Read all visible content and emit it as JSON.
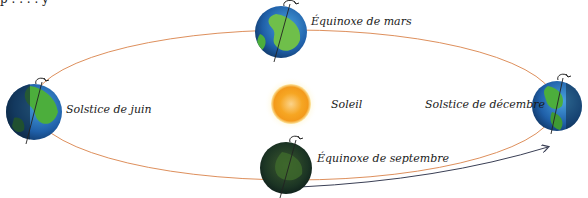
{
  "top_fragment": "p . . . . y",
  "colors": {
    "orbit": "#d9824a",
    "arrow": "#3a3f55",
    "sun_core": "#f6a623",
    "sun_glow": "#fde9a8",
    "earth_ocean": "#1f5fa8",
    "earth_land": "#4cae3c",
    "earth_dark": "#0f2a3a",
    "axis": "#222222"
  },
  "sun": {
    "label": "Soleil",
    "cx": 291,
    "cy": 104,
    "r": 20
  },
  "orbit": {
    "cx": 294,
    "cy": 105,
    "rx": 262,
    "ry": 75
  },
  "positions": [
    {
      "id": "solstice-juin",
      "label": "Solstice de juin",
      "cx": 34,
      "cy": 112,
      "r": 28,
      "phase": "lit-right"
    },
    {
      "id": "equinoxe-mars",
      "label": "Équinoxe de mars",
      "cx": 281,
      "cy": 32,
      "r": 26,
      "phase": "lit-full"
    },
    {
      "id": "solstice-decembre",
      "label": "Solstice de décembre",
      "cx": 557,
      "cy": 106,
      "r": 25,
      "phase": "lit-left"
    },
    {
      "id": "equinoxe-septembre",
      "label": "Équinoxe de septembre",
      "cx": 286,
      "cy": 168,
      "r": 26,
      "phase": "dark"
    }
  ],
  "direction_arrow": {
    "from": [
      300,
      186
    ],
    "to": [
      548,
      148
    ],
    "meaning": "sens de révolution"
  }
}
